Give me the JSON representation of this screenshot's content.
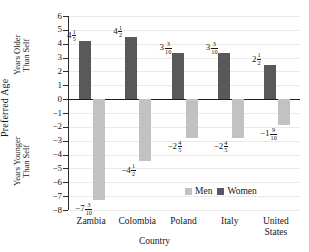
{
  "chart_data": {
    "type": "bar",
    "title": "",
    "xlabel": "Country",
    "ylabel": "Preferred Age",
    "ylabel_upper": "Years Older\nThan Self",
    "ylabel_lower": "Years Younger\nThan Self",
    "categories": [
      "Zambia",
      "Colombia",
      "Poland",
      "Italy",
      "United\nStates"
    ],
    "ylim": [
      -8,
      6
    ],
    "yticks": [
      6,
      5,
      4,
      3,
      2,
      1,
      0,
      -1,
      -2,
      -3,
      -4,
      -5,
      -6,
      -7,
      -8
    ],
    "ytick_labels": [
      "6",
      "5",
      "4",
      "3",
      "2",
      "1",
      "0",
      "−1",
      "−2",
      "−3",
      "−4",
      "−5",
      "−6",
      "−7",
      "−8"
    ],
    "grid": true,
    "legend_position": "inside-bottom-right",
    "series": [
      {
        "name": "Men",
        "color": "#c2c2c2",
        "values": [
          -7.3,
          -4.5,
          -2.8,
          -2.8,
          -1.9
        ],
        "labels": [
          {
            "sign": "−",
            "whole": "7",
            "num": "3",
            "den": "10"
          },
          {
            "sign": "−",
            "whole": "4",
            "num": "1",
            "den": "2"
          },
          {
            "sign": "−",
            "whole": "2",
            "num": "4",
            "den": "5"
          },
          {
            "sign": "−",
            "whole": "2",
            "num": "4",
            "den": "5"
          },
          {
            "sign": "−",
            "whole": "1",
            "num": "9",
            "den": "10"
          }
        ]
      },
      {
        "name": "Women",
        "color": "#59595c",
        "values": [
          4.2,
          4.5,
          3.3,
          3.3,
          2.5
        ],
        "labels": [
          {
            "sign": "",
            "whole": "4",
            "num": "1",
            "den": "5"
          },
          {
            "sign": "",
            "whole": "4",
            "num": "1",
            "den": "2"
          },
          {
            "sign": "",
            "whole": "3",
            "num": "3",
            "den": "10"
          },
          {
            "sign": "",
            "whole": "3",
            "num": "3",
            "den": "10"
          },
          {
            "sign": "",
            "whole": "2",
            "num": "1",
            "den": "2"
          }
        ]
      }
    ]
  },
  "legend": {
    "men_label": "Men",
    "women_label": "Women"
  },
  "axis": {
    "x_title": "Country",
    "y_title": "Preferred Age",
    "y_upper": "Years Older\nThan Self",
    "y_lower": "Years Younger\nThan Self"
  }
}
